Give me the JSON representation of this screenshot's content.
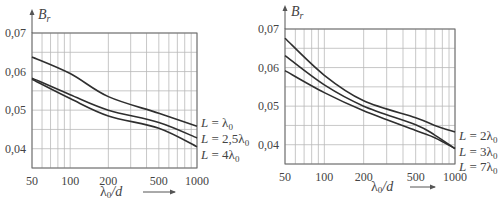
{
  "chart_data": [
    {
      "type": "line",
      "title": "",
      "ylabel": "B_r",
      "ylabel_main": "B",
      "ylabel_sub": "r",
      "xlabel": "λ₀/d",
      "xlabel_main": "λ",
      "xlabel_sub": "0",
      "xlabel_rest": "/d",
      "xscale": "log",
      "xlim": [
        50,
        1000
      ],
      "ylim": [
        0.035,
        0.07
      ],
      "grid": true,
      "x_ticks": [
        50,
        100,
        200,
        500,
        1000
      ],
      "x_tick_labels": [
        "50",
        "100",
        "200",
        "500",
        "1000"
      ],
      "x_minor_grid": [
        60,
        70,
        80,
        90,
        300,
        400,
        600,
        700,
        800,
        900
      ],
      "y_ticks": [
        0.04,
        0.05,
        0.06,
        0.07
      ],
      "y_tick_labels": [
        "0,04",
        "0,05",
        "0,06",
        "0,07"
      ],
      "y_grid": [
        0.035,
        0.04,
        0.045,
        0.05,
        0.055,
        0.06,
        0.065,
        0.07
      ],
      "x": [
        50,
        100,
        200,
        500,
        1000
      ],
      "series": [
        {
          "name": "L = λ0",
          "label_main": "L = ",
          "label_coef": "",
          "label_sym": "λ",
          "label_sub": "0",
          "values": [
            0.0638,
            0.0595,
            0.0535,
            0.0492,
            0.0458
          ]
        },
        {
          "name": "L = 2,5λ0",
          "label_main": "L = ",
          "label_coef": "2,5",
          "label_sym": "λ",
          "label_sub": "0",
          "values": [
            0.0583,
            0.054,
            0.05,
            0.0468,
            0.0428
          ]
        },
        {
          "name": "L = 4λ0",
          "label_main": "L = ",
          "label_coef": "4",
          "label_sym": "λ",
          "label_sub": "0",
          "values": [
            0.058,
            0.053,
            0.0485,
            0.0453,
            0.0405
          ]
        }
      ],
      "legend_position": "right-inline"
    },
    {
      "type": "line",
      "title": "",
      "ylabel": "B_r",
      "ylabel_main": "B",
      "ylabel_sub": "r",
      "xlabel": "λ₀/d",
      "xlabel_main": "λ",
      "xlabel_sub": "0",
      "xlabel_rest": "/d",
      "xscale": "log",
      "xlim": [
        50,
        1000
      ],
      "ylim": [
        0.035,
        0.07
      ],
      "grid": true,
      "x_ticks": [
        50,
        100,
        200,
        500,
        1000
      ],
      "x_tick_labels": [
        "50",
        "100",
        "200",
        "500",
        "1000"
      ],
      "x_minor_grid": [
        60,
        70,
        80,
        90,
        300,
        400,
        600,
        700,
        800,
        900
      ],
      "y_ticks": [
        0.04,
        0.05,
        0.06,
        0.07
      ],
      "y_tick_labels": [
        "0,04",
        "0,05",
        "0,06",
        "0,07"
      ],
      "y_grid": [
        0.035,
        0.04,
        0.045,
        0.05,
        0.055,
        0.06,
        0.065,
        0.07
      ],
      "x": [
        50,
        100,
        200,
        500,
        700,
        1000
      ],
      "series": [
        {
          "name": "L = 2λ0",
          "label_main": "L = ",
          "label_coef": "2",
          "label_sym": "λ",
          "label_sub": "0",
          "values": [
            0.0676,
            0.058,
            0.0514,
            0.047,
            0.045,
            0.0433
          ]
        },
        {
          "name": "L = 3λ0",
          "label_main": "L = ",
          "label_coef": "3",
          "label_sym": "λ",
          "label_sub": "0",
          "values": [
            0.0631,
            0.0555,
            0.05,
            0.0452,
            0.0425,
            0.039
          ]
        },
        {
          "name": "L = 7λ0",
          "label_main": "L = ",
          "label_coef": "7",
          "label_sym": "λ",
          "label_sub": "0",
          "values": [
            0.0592,
            0.0535,
            0.0488,
            0.0437,
            0.0418,
            0.039
          ]
        }
      ],
      "legend_position": "right-inline"
    }
  ],
  "layout": {
    "panels": [
      {
        "left": 32,
        "right": 197,
        "top": 33,
        "bottom": 168,
        "label_x": 201,
        "label_y": [
          127,
          143,
          159
        ],
        "ylabel_x": 38,
        "ylabel_y": 19,
        "xlabel_x": 100,
        "xlabel_y": 196,
        "arrow_x1": 143,
        "arrow_x2": 175,
        "yticks_x": 26
      },
      {
        "left": 285,
        "right": 455,
        "top": 29,
        "bottom": 164,
        "label_x": 459,
        "label_y": [
          140,
          156,
          171
        ],
        "ylabel_x": 291,
        "ylabel_y": 16,
        "xlabel_x": 371,
        "xlabel_y": 191,
        "arrow_x1": 410,
        "arrow_x2": 435,
        "yticks_x": 279
      }
    ]
  }
}
